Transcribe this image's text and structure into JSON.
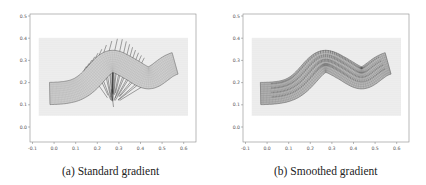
{
  "figure": {
    "panels": [
      {
        "id": "a",
        "caption": "(a) Standard gradient",
        "variant": "standard"
      },
      {
        "id": "b",
        "caption": "(b) Smoothed gradient",
        "variant": "smoothed"
      }
    ]
  },
  "chart_data": [
    {
      "type": "scatter",
      "title": "(a) Standard gradient",
      "xlabel": "",
      "ylabel": "",
      "xlim": [
        -0.12,
        0.64
      ],
      "ylim": [
        -0.07,
        0.51
      ],
      "xticks": [
        -0.1,
        0.0,
        0.1,
        0.2,
        0.3,
        0.4,
        0.5,
        0.6
      ],
      "xtick_labels": [
        "-0.1",
        "0.0",
        "0.1",
        "0.2",
        "0.3",
        "0.4",
        "0.5",
        "0.6"
      ],
      "yticks": [
        0.0,
        0.1,
        0.2,
        0.3,
        0.4,
        0.5
      ],
      "ytick_labels": [
        "0.0",
        "0.1",
        "0.2",
        "0.3",
        "0.4",
        "0.5"
      ],
      "grid": false,
      "background_particle_region": {
        "x": [
          -0.07,
          0.62
        ],
        "y": [
          0.05,
          0.4
        ]
      },
      "band": {
        "left_end": {
          "top": [
            -0.03,
            0.2
          ],
          "bottom": [
            -0.01,
            0.1
          ]
        },
        "right_end": {
          "top": [
            0.55,
            0.32
          ],
          "bottom": [
            0.57,
            0.21
          ]
        },
        "centerline_peak": [
          0.27,
          0.3
        ],
        "thickness": 0.1
      },
      "arrows": {
        "description": "gradient vectors concentrated near band boundary, converging toward a point near (0.27, 0.11)",
        "convergence_point": [
          0.27,
          0.1
        ]
      }
    },
    {
      "type": "scatter",
      "title": "(b) Smoothed gradient",
      "xlabel": "",
      "ylabel": "",
      "xlim": [
        -0.12,
        0.64
      ],
      "ylim": [
        -0.07,
        0.51
      ],
      "xticks": [
        -0.1,
        0.0,
        0.1,
        0.2,
        0.3,
        0.4,
        0.5,
        0.6
      ],
      "xtick_labels": [
        "-0.1",
        "0.0",
        "0.1",
        "0.2",
        "0.3",
        "0.4",
        "0.5",
        "0.6"
      ],
      "yticks": [
        0.0,
        0.1,
        0.2,
        0.3,
        0.4,
        0.5
      ],
      "ytick_labels": [
        "0.0",
        "0.1",
        "0.2",
        "0.3",
        "0.4",
        "0.5"
      ],
      "grid": false,
      "background_particle_region": {
        "x": [
          -0.07,
          0.62
        ],
        "y": [
          0.05,
          0.4
        ]
      },
      "band": {
        "left_end": {
          "top": [
            -0.04,
            0.2
          ],
          "bottom": [
            -0.02,
            0.1
          ]
        },
        "right_end": {
          "top": [
            0.55,
            0.31
          ],
          "bottom": [
            0.57,
            0.22
          ]
        },
        "centerline_peak": [
          0.25,
          0.3
        ],
        "thickness": 0.1
      },
      "arrows": {
        "description": "short uniform vertical gradient vectors distributed across the band interior"
      }
    }
  ]
}
